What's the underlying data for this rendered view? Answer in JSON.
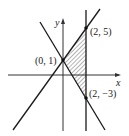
{
  "diagram": {
    "type": "feasible-region-graph",
    "axes": {
      "x_label": "x",
      "y_label": "y"
    },
    "points": [
      {
        "label": "(0, 1)",
        "x": 0,
        "y": 1
      },
      {
        "label": "(2, 5)",
        "x": 2,
        "y": 5
      },
      {
        "label": "(2, −3)",
        "x": 2,
        "y": -3
      }
    ],
    "lines": [
      {
        "name": "y = 2x + 1"
      },
      {
        "name": "y = -2x + 1"
      },
      {
        "name": "x = 2"
      }
    ],
    "shaded_region": "triangle with vertices (0, 1), (2, 5), (2, −3)",
    "colors": {
      "line": "#1a1a1a",
      "axis": "#333333",
      "background": "#ffffff"
    }
  }
}
